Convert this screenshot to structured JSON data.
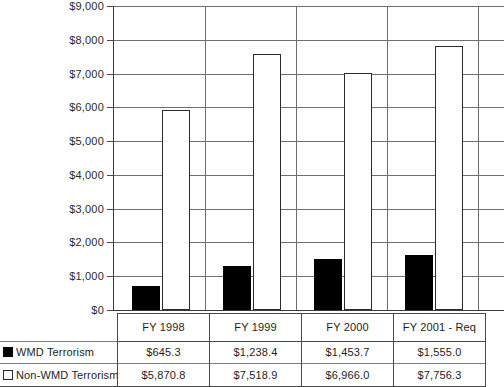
{
  "chart_data": {
    "type": "bar",
    "title": "",
    "subtitle": "",
    "xlabel": "",
    "ylabel": "",
    "categories": [
      "FY 1998",
      "FY 1999",
      "FY 2000",
      "FY 2001 - Req"
    ],
    "series": [
      {
        "name": "WMD Terrorism",
        "marker": "filled-square",
        "color": "#000000",
        "values": [
          645.3,
          1238.4,
          1453.7,
          1555.0
        ],
        "labels": [
          "$645.3",
          "$1,238.4",
          "$1,453.7",
          "$1,555.0"
        ]
      },
      {
        "name": "Non-WMD Terrorism",
        "marker": "hollow-square",
        "color": "#ffffff",
        "values": [
          5870.8,
          7518.9,
          6966.0,
          7756.3
        ],
        "labels": [
          "$5,870.8",
          "$7,518.9",
          "$6,966.0",
          "$7,756.3"
        ]
      }
    ],
    "ylim": [
      0,
      9000
    ],
    "ytick_values": [
      0,
      1000,
      2000,
      3000,
      4000,
      5000,
      6000,
      7000,
      8000,
      9000
    ],
    "ytick_labels": [
      "$0",
      "$1,000",
      "$2,000",
      "$3,000",
      "$4,000",
      "$5,000",
      "$6,000",
      "$7,000",
      "$8,000",
      "$9,000"
    ],
    "grid": "horizontal-and-category-separators",
    "legend_position": "data-table-left-column",
    "data_table_visible": true
  },
  "table": {
    "legend_header": "",
    "rows": [
      {
        "label": "WMD Terrorism",
        "marker": "filled-square",
        "cells": [
          "$645.3",
          "$1,238.4",
          "$1,453.7",
          "$1,555.0"
        ]
      },
      {
        "label": "Non-WMD Terrorism",
        "marker": "hollow-square",
        "cells": [
          "$5,870.8",
          "$7,518.9",
          "$6,966.0",
          "$7,756.3"
        ]
      }
    ]
  },
  "colors": {
    "wmd_bar": "#000000",
    "nonwmd_bar": "#ffffff",
    "bar_outline": "#2b2b2b",
    "gridline": "#6e6e6e",
    "axis": "#3a3a3a",
    "background": "#ffffff",
    "text": "#1d1d1d"
  }
}
